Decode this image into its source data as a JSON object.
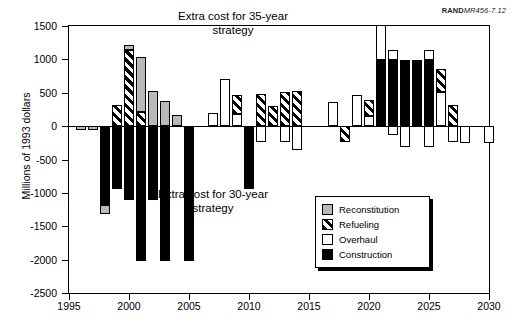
{
  "credit": {
    "bold": "RAND",
    "italic": "MR456-7.12"
  },
  "annotations": [
    {
      "id": "note35",
      "text": "Extra cost for 35-year\nstrategy"
    },
    {
      "id": "note30",
      "text": "Extra cost for 30-year\nstrategy"
    }
  ],
  "legend": {
    "items": [
      {
        "key": "reconstitution",
        "label": "Reconstitution",
        "color": "#b9b9b9"
      },
      {
        "key": "refueling",
        "label": "Refueling",
        "color": "#000000"
      },
      {
        "key": "overhaul",
        "label": "Overhaul",
        "color": "#ffffff"
      },
      {
        "key": "construction",
        "label": "Construction",
        "color": "#000000"
      }
    ]
  },
  "chart_data": {
    "type": "bar",
    "subtype": "stacked-bar-diverging",
    "title": "",
    "xlabel": "",
    "ylabel": "Millions of 1993 dollars",
    "xlim": [
      1995,
      2030
    ],
    "ylim": [
      -2500,
      1500
    ],
    "yticks": [
      1500,
      1000,
      500,
      0,
      -500,
      -1000,
      -1500,
      -2000,
      -2500
    ],
    "ytick_labels": [
      "1500",
      "1000",
      "500",
      "0",
      "-500",
      "-1000",
      "-1500",
      "-2000",
      "-2500"
    ],
    "xticks": [
      1995,
      2000,
      2005,
      2010,
      2015,
      2020,
      2025,
      2030
    ],
    "xtick_labels": [
      "1995",
      "2000",
      "2005",
      "2010",
      "2015",
      "2020",
      "2025",
      "2030"
    ],
    "grid": false,
    "legend_position": "lower-right",
    "series_names": [
      "Reconstitution",
      "Refueling",
      "Overhaul",
      "Construction"
    ],
    "bars": [
      {
        "year": 1996,
        "segments": [
          {
            "cat": "reconstitution",
            "from": 0,
            "to": -55
          }
        ]
      },
      {
        "year": 1997,
        "segments": [
          {
            "cat": "reconstitution",
            "from": 0,
            "to": -65
          }
        ]
      },
      {
        "year": 1998,
        "segments": [
          {
            "cat": "construction",
            "from": 0,
            "to": -1185
          },
          {
            "cat": "reconstitution",
            "from": -1185,
            "to": -1320
          }
        ]
      },
      {
        "year": 1999,
        "segments": [
          {
            "cat": "refueling",
            "from": 0,
            "to": 310
          },
          {
            "cat": "construction",
            "from": 0,
            "to": -935
          }
        ]
      },
      {
        "year": 2000,
        "segments": [
          {
            "cat": "refueling",
            "from": 0,
            "to": 1135
          },
          {
            "cat": "reconstitution",
            "from": 1135,
            "to": 1215
          },
          {
            "cat": "construction",
            "from": 0,
            "to": -1110
          }
        ]
      },
      {
        "year": 2001,
        "segments": [
          {
            "cat": "refueling",
            "from": 0,
            "to": 215
          },
          {
            "cat": "reconstitution",
            "from": 215,
            "to": 1030
          },
          {
            "cat": "construction",
            "from": 0,
            "to": -2020
          }
        ]
      },
      {
        "year": 2002,
        "segments": [
          {
            "cat": "reconstitution",
            "from": 0,
            "to": 530
          },
          {
            "cat": "construction",
            "from": 0,
            "to": -1110
          }
        ]
      },
      {
        "year": 2003,
        "segments": [
          {
            "cat": "reconstitution",
            "from": 0,
            "to": 370
          },
          {
            "cat": "construction",
            "from": 0,
            "to": -2020
          }
        ]
      },
      {
        "year": 2004,
        "segments": [
          {
            "cat": "reconstitution",
            "from": 0,
            "to": 160
          }
        ]
      },
      {
        "year": 2005,
        "segments": [
          {
            "cat": "construction",
            "from": 0,
            "to": -2020
          }
        ]
      },
      {
        "year": 2007,
        "segments": [
          {
            "cat": "overhaul",
            "from": 0,
            "to": 190
          }
        ]
      },
      {
        "year": 2008,
        "segments": [
          {
            "cat": "overhaul",
            "from": 0,
            "to": 700
          }
        ]
      },
      {
        "year": 2009,
        "segments": [
          {
            "cat": "overhaul",
            "from": 0,
            "to": 180
          },
          {
            "cat": "refueling",
            "from": 180,
            "to": 460
          }
        ]
      },
      {
        "year": 2010,
        "segments": [
          {
            "cat": "construction",
            "from": 0,
            "to": -935
          }
        ]
      },
      {
        "year": 2011,
        "segments": [
          {
            "cat": "refueling",
            "from": 0,
            "to": 480
          },
          {
            "cat": "overhaul",
            "from": 0,
            "to": -235
          }
        ]
      },
      {
        "year": 2012,
        "segments": [
          {
            "cat": "refueling",
            "from": 0,
            "to": 295
          }
        ]
      },
      {
        "year": 2013,
        "segments": [
          {
            "cat": "refueling",
            "from": 0,
            "to": 510
          },
          {
            "cat": "overhaul",
            "from": 0,
            "to": -235
          }
        ]
      },
      {
        "year": 2014,
        "segments": [
          {
            "cat": "refueling",
            "from": 0,
            "to": 520
          },
          {
            "cat": "overhaul",
            "from": 0,
            "to": -365
          }
        ]
      },
      {
        "year": 2017,
        "segments": [
          {
            "cat": "overhaul",
            "from": 0,
            "to": 360
          }
        ]
      },
      {
        "year": 2018,
        "segments": [
          {
            "cat": "refueling",
            "from": 0,
            "to": -235
          }
        ]
      },
      {
        "year": 2019,
        "segments": [
          {
            "cat": "overhaul",
            "from": 0,
            "to": 465
          }
        ]
      },
      {
        "year": 2020,
        "segments": [
          {
            "cat": "overhaul",
            "from": 0,
            "to": 155
          },
          {
            "cat": "refueling",
            "from": 155,
            "to": 395
          }
        ]
      },
      {
        "year": 2021,
        "segments": [
          {
            "cat": "construction",
            "from": 0,
            "to": 990
          },
          {
            "cat": "overhaul",
            "from": 990,
            "to": 1510
          }
        ]
      },
      {
        "year": 2022,
        "segments": [
          {
            "cat": "construction",
            "from": 0,
            "to": 990
          },
          {
            "cat": "overhaul",
            "from": 990,
            "to": 1140
          },
          {
            "cat": "overhaul",
            "from": 0,
            "to": -135
          }
        ]
      },
      {
        "year": 2023,
        "segments": [
          {
            "cat": "construction",
            "from": 0,
            "to": 990
          },
          {
            "cat": "overhaul",
            "from": 0,
            "to": -320
          }
        ]
      },
      {
        "year": 2024,
        "segments": [
          {
            "cat": "construction",
            "from": 0,
            "to": 990
          }
        ]
      },
      {
        "year": 2025,
        "segments": [
          {
            "cat": "construction",
            "from": 0,
            "to": 990
          },
          {
            "cat": "overhaul",
            "from": 990,
            "to": 1140
          },
          {
            "cat": "overhaul",
            "from": 0,
            "to": -310
          }
        ]
      },
      {
        "year": 2026,
        "segments": [
          {
            "cat": "overhaul",
            "from": 0,
            "to": 505
          },
          {
            "cat": "refueling",
            "from": 505,
            "to": 860
          }
        ]
      },
      {
        "year": 2027,
        "segments": [
          {
            "cat": "refueling",
            "from": 0,
            "to": 320
          },
          {
            "cat": "overhaul",
            "from": 0,
            "to": -235
          }
        ]
      },
      {
        "year": 2028,
        "segments": [
          {
            "cat": "overhaul",
            "from": 0,
            "to": -255
          }
        ]
      },
      {
        "year": 2030,
        "segments": [
          {
            "cat": "overhaul",
            "from": 0,
            "to": -255
          }
        ]
      }
    ]
  }
}
